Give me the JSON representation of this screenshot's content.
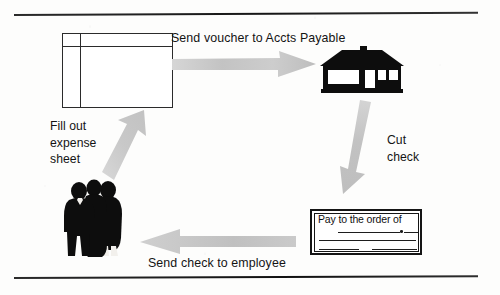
{
  "figure": {
    "type": "process-flow-diagram",
    "topic": "Employee expense reimbursement cycle",
    "background_color": "#fdfdfc",
    "ink_color": "#141414",
    "arrow_color": "#c9c9c9"
  },
  "rules": {
    "top_label": "page-rule-top",
    "bottom_label": "page-rule-bottom"
  },
  "nodes": [
    {
      "id": "expense-sheet",
      "icon": "spreadsheet-icon",
      "caption": "expense sheet document"
    },
    {
      "id": "accounts-payable-building",
      "icon": "house-icon",
      "caption": "Accounts Payable office building"
    },
    {
      "id": "check",
      "icon": "check-icon",
      "caption": "paper check",
      "pay_to_text": "Pay to the order of"
    },
    {
      "id": "employees",
      "icon": "people-group-icon",
      "caption": "group of three employees"
    }
  ],
  "steps": [
    {
      "id": "send-voucher",
      "label": "Send voucher to Accts Payable",
      "arrow": "arrow-right-icon",
      "from": "expense-sheet",
      "to": "accounts-payable-building"
    },
    {
      "id": "cut-check",
      "label": "Cut\ncheck",
      "label_lines": [
        "Cut",
        "check"
      ],
      "arrow": "arrow-down-icon",
      "from": "accounts-payable-building",
      "to": "check"
    },
    {
      "id": "send-check",
      "label": "Send check to employee",
      "arrow": "arrow-left-icon",
      "from": "check",
      "to": "employees"
    },
    {
      "id": "fill-out-expense-sheet",
      "label": "Fill out\nexpense\nsheet",
      "label_lines": [
        "Fill out",
        "expense",
        "sheet"
      ],
      "arrow": "arrow-up-right-icon",
      "from": "employees",
      "to": "expense-sheet"
    }
  ],
  "labels": {
    "send_voucher": "Send voucher to Accts Payable",
    "fill_out_expense_sheet": "Fill out\nexpense\nsheet",
    "cut_check": "Cut\ncheck",
    "send_check_to_employee": "Send check to employee"
  },
  "check_face": {
    "pay_to_the_order_of": "Pay to the order of"
  }
}
